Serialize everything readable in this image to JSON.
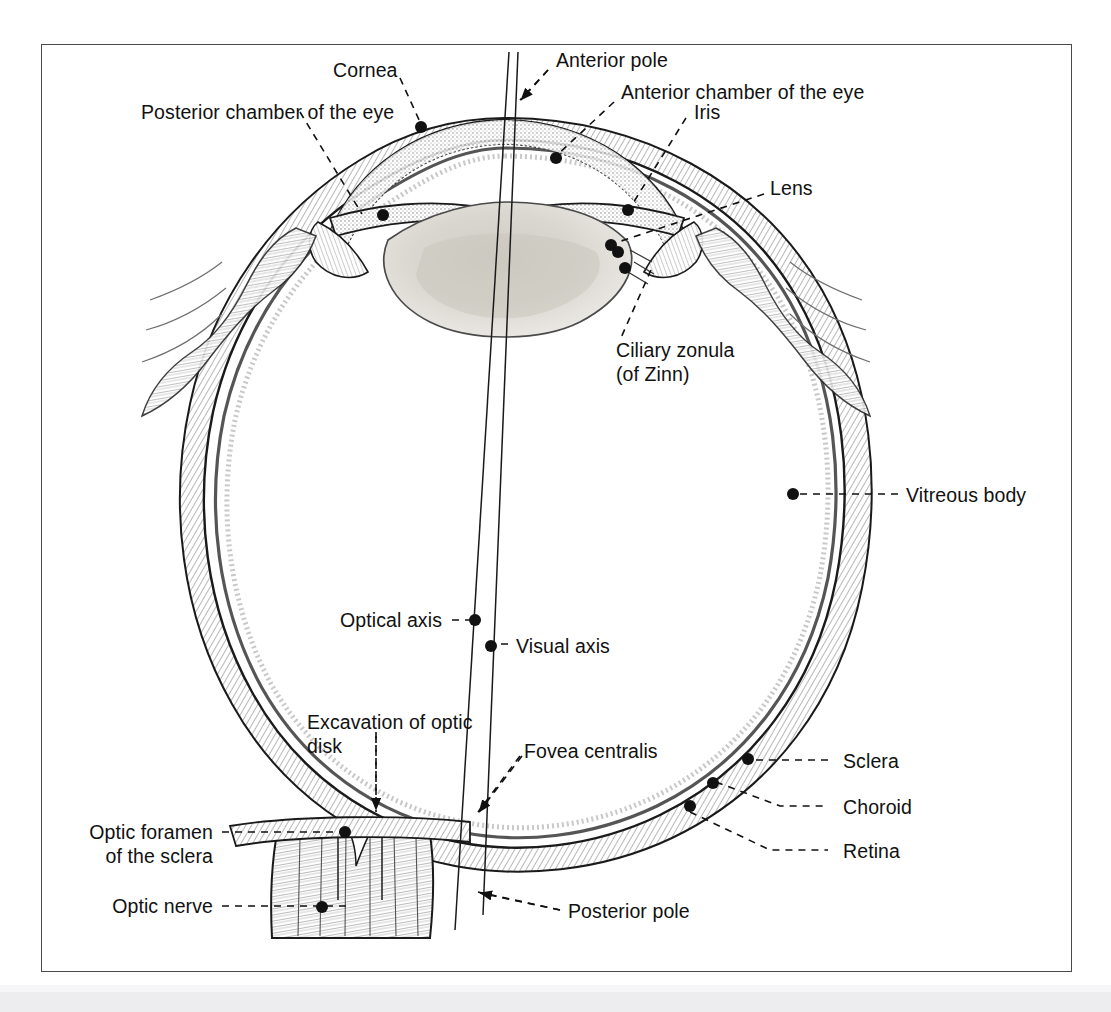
{
  "figure": {
    "frame_color": "#4a4a4a",
    "ink_color": "#1a1a1a",
    "lens_fill": "#d9d6cf",
    "background": "#ffffff"
  },
  "labels": {
    "posterior_chamber": "Posterior chamber of the eye",
    "cornea": "Cornea",
    "anterior_pole": "Anterior pole",
    "anterior_chamber": "Anterior chamber of the eye",
    "iris": "Iris",
    "lens": "Lens",
    "ciliary_zonula_line1": "Ciliary zonula",
    "ciliary_zonula_line2": "(of Zinn)",
    "vitreous_body": "Vitreous body",
    "optical_axis": "Optical axis",
    "visual_axis": "Visual axis",
    "excavation_line1": "Excavation of optic",
    "excavation_line2": "disk",
    "fovea_centralis": "Fovea centralis",
    "sclera": "Sclera",
    "choroid": "Choroid",
    "retina": "Retina",
    "optic_foramen_line1": "Optic foramen",
    "optic_foramen_line2": "of the sclera",
    "optic_nerve": "Optic nerve",
    "posterior_pole": "Posterior pole"
  },
  "structures": [
    {
      "name": "cornea",
      "type": "outer-coat-anterior"
    },
    {
      "name": "sclera",
      "type": "outer-coat"
    },
    {
      "name": "choroid",
      "type": "middle-coat"
    },
    {
      "name": "retina",
      "type": "inner-coat"
    },
    {
      "name": "lens",
      "type": "biconvex-body"
    },
    {
      "name": "iris",
      "type": "diaphragm"
    },
    {
      "name": "ciliary-body",
      "type": "muscle"
    },
    {
      "name": "vitreous-body",
      "type": "chamber"
    },
    {
      "name": "anterior-chamber",
      "type": "chamber"
    },
    {
      "name": "posterior-chamber",
      "type": "chamber"
    },
    {
      "name": "optic-nerve",
      "type": "nerve"
    },
    {
      "name": "optic-disk",
      "type": "landmark"
    },
    {
      "name": "fovea-centralis",
      "type": "landmark"
    }
  ],
  "axes": [
    {
      "name": "optical-axis",
      "label": "Optical axis"
    },
    {
      "name": "visual-axis",
      "label": "Visual axis"
    }
  ]
}
